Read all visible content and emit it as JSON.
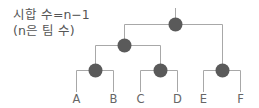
{
  "caption": {
    "line1": "시합 수=n−1",
    "line2": "(n은 팀 수)"
  },
  "colors": {
    "node": "#5a5a5a",
    "line": "#a8a8a8",
    "text": "#555555"
  },
  "tree": {
    "type": "single-elimination-bracket",
    "teams": [
      "A",
      "B",
      "C",
      "D",
      "E",
      "F"
    ],
    "leaves": [
      {
        "label": "A",
        "x": 76
      },
      {
        "label": "B",
        "x": 113
      },
      {
        "label": "C",
        "x": 140
      },
      {
        "label": "D",
        "x": 177
      },
      {
        "label": "E",
        "x": 203
      },
      {
        "label": "F",
        "x": 240
      }
    ],
    "matches": 5
  }
}
